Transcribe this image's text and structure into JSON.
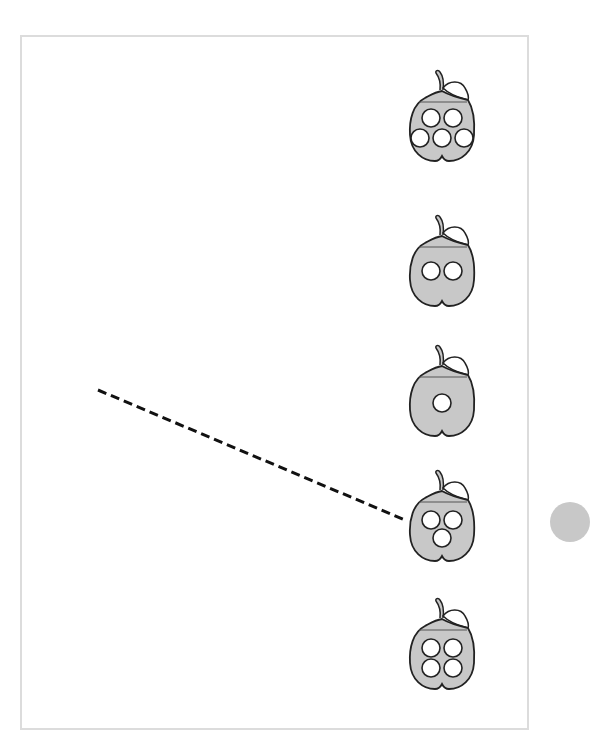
{
  "worksheet": {
    "type": "counting-match",
    "fill_color": "#c8c8c8",
    "stroke_color": "#222222",
    "apples": [
      {
        "id": 1,
        "dots": 5,
        "top": 60
      },
      {
        "id": 2,
        "dots": 2,
        "top": 205
      },
      {
        "id": 3,
        "dots": 1,
        "top": 335
      },
      {
        "id": 4,
        "dots": 3,
        "top": 460
      },
      {
        "id": 5,
        "dots": 4,
        "top": 588
      }
    ],
    "dashed_line": {
      "from": [
        98,
        390
      ],
      "to": [
        405,
        520
      ],
      "connects_apple": 4
    }
  }
}
